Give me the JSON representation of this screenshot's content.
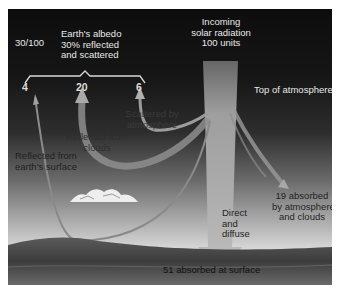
{
  "diagram": {
    "labels": {
      "albedo_ratio": "30/100",
      "albedo_title": "Earth's albedo\n30% reflected\nand scattered",
      "incoming": "Incoming\nsolar radiation\n100 units",
      "top_of_atmosphere": "Top of atmosphere",
      "reflected_surface_value": "4",
      "reflected_clouds_value": "20",
      "scattered_value": "6",
      "scattered_by_atmosphere": "Scattered by\natmosphere",
      "reflected_from_clouds": "Reflected from\nclouds",
      "reflected_from_surface": "Reflected from\nearth's surface",
      "absorbed_atmosphere": "19 absorbed\nby atmosphere\nand clouds",
      "direct_diffuse": "Direct\nand\ndiffuse",
      "absorbed_surface": "51 absorbed at surface"
    },
    "flows": [
      {
        "name": "Incoming solar radiation",
        "units": 100
      },
      {
        "name": "Reflected from earth's surface",
        "units": 4
      },
      {
        "name": "Reflected from clouds",
        "units": 20
      },
      {
        "name": "Scattered by atmosphere",
        "units": 6
      },
      {
        "name": "Absorbed by atmosphere and clouds",
        "units": 19
      },
      {
        "name": "Absorbed at surface (direct and diffuse)",
        "units": 51
      }
    ],
    "colors": {
      "sky_top": "#0d0d0d",
      "sky_bottom": "#e2e2e2",
      "arrow": "#b5b5b5",
      "ground": "#4a4a4a"
    }
  }
}
